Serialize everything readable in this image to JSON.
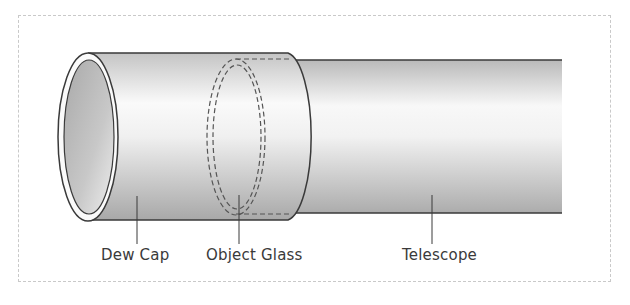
{
  "figure": {
    "type": "labeled-illustration",
    "colors": {
      "frame_border": "#c9c9c9",
      "outline": "#3a3a3a",
      "tube_dark": "#b5b5b5",
      "tube_light": "#f7f7f7",
      "inner_bore": "#bdbdbd",
      "label_text": "#3a3a3a"
    }
  },
  "labels": {
    "dew_cap": "Dew Cap",
    "object_glass": "Object Glass",
    "telescope": "Telescope"
  }
}
